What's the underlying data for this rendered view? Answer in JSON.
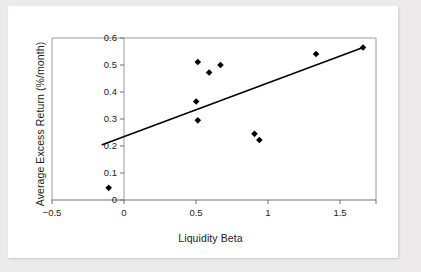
{
  "figure": {
    "background_color": "#eceaea",
    "card_color": "#ffffff",
    "frame_color": "#9a9a9a"
  },
  "chart_data": {
    "type": "scatter",
    "title": "",
    "xlabel": "Liquidity Beta",
    "ylabel": "Average Excess Return (%/month)",
    "xlim": [
      -0.5,
      1.5
    ],
    "ylim": [
      0.0,
      0.6
    ],
    "xticks": [
      -0.5,
      0,
      0.5,
      1,
      1.5
    ],
    "xtick_labels": [
      "−0.5",
      "0",
      "0.5",
      "1",
      "1.5"
    ],
    "yticks": [
      0,
      0.1,
      0.2,
      0.3,
      0.4,
      0.5,
      0.6
    ],
    "ytick_labels": [
      "0",
      "0.1",
      "0.2",
      "0.3",
      "0.4",
      "0.5",
      "0.6"
    ],
    "grid": false,
    "legend": null,
    "marker": "diamond",
    "marker_color": "#000000",
    "x": [
      -0.15,
      0.39,
      0.4,
      0.4,
      0.47,
      0.54,
      0.75,
      0.78,
      1.13,
      1.42
    ],
    "y": [
      0.045,
      0.365,
      0.295,
      0.511,
      0.472,
      0.5,
      0.245,
      0.222,
      0.541,
      0.565
    ],
    "points": [
      {
        "x": -0.15,
        "y": 0.045
      },
      {
        "x": 0.39,
        "y": 0.365
      },
      {
        "x": 0.4,
        "y": 0.295
      },
      {
        "x": 0.4,
        "y": 0.511
      },
      {
        "x": 0.47,
        "y": 0.472
      },
      {
        "x": 0.54,
        "y": 0.5
      },
      {
        "x": 0.75,
        "y": 0.245
      },
      {
        "x": 0.78,
        "y": 0.222
      },
      {
        "x": 1.13,
        "y": 0.541
      },
      {
        "x": 1.42,
        "y": 0.565
      }
    ],
    "trendline": {
      "type": "line",
      "color": "#000000",
      "x": [
        -0.19,
        1.42
      ],
      "y": [
        0.205,
        0.565
      ]
    }
  }
}
